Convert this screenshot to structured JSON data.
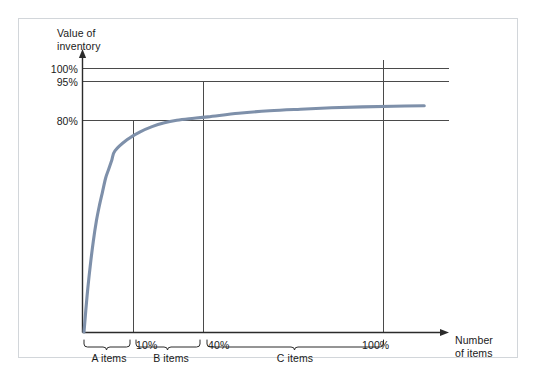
{
  "chart_data": {
    "type": "line",
    "title": "",
    "subtitle": "",
    "xlabel": "Number of items",
    "ylabel": "Value of inventory",
    "grid": true,
    "legend": null,
    "xlim": [
      0,
      118
    ],
    "ylim": [
      0,
      118
    ],
    "x_ticks": [
      {
        "value": 10,
        "label": "10%"
      },
      {
        "value": 40,
        "label": "40%"
      },
      {
        "value": 100,
        "label": "100%"
      }
    ],
    "y_ticks": [
      {
        "value": 80,
        "label": "80%"
      },
      {
        "value": 95,
        "label": "95%"
      },
      {
        "value": 100,
        "label": "100%"
      }
    ],
    "annotations": [
      {
        "label": "A items",
        "x_start": 0,
        "x_end": 10
      },
      {
        "label": "B items",
        "x_start": 10,
        "x_end": 40
      },
      {
        "label": "C items",
        "x_start": 40,
        "x_end": 100
      }
    ],
    "series": [
      {
        "name": "Cumulative value of inventory",
        "color": "#7e90aa",
        "x": [
          0,
          1,
          2,
          3,
          4,
          5,
          6,
          7,
          8,
          9,
          10,
          14,
          18,
          22,
          26,
          30,
          34,
          40,
          50,
          60,
          70,
          80,
          90,
          100,
          110
        ],
        "values": [
          0,
          16,
          29,
          40,
          49,
          56,
          62,
          68,
          72,
          76,
          80,
          85,
          88.3,
          90.7,
          92.4,
          93.5,
          94.2,
          95,
          96.6,
          97.7,
          98.4,
          99,
          99.4,
          99.7,
          99.9
        ]
      }
    ],
    "reference_lines": {
      "horizontal": [
        {
          "y": 100,
          "label": "100%"
        },
        {
          "y": 95,
          "label": "95%"
        },
        {
          "y": 80,
          "label": "80%"
        }
      ],
      "vertical": [
        {
          "x": 10,
          "label": "10%"
        },
        {
          "x": 40,
          "label": "40%"
        },
        {
          "x": 100,
          "label": "100%"
        }
      ]
    }
  },
  "axes": {
    "y_title": "Value of\ninventory",
    "x_title": "Number\nof items"
  },
  "labels": {
    "y_100": "100%",
    "y_95": "95%",
    "y_80": "80%",
    "x_10": "10%",
    "x_40": "40%",
    "x_100": "100%",
    "seg_a": "A items",
    "seg_b": "B items",
    "seg_c": "C items"
  },
  "colors": {
    "curve": "#7e90aa",
    "axis": "#2b2b2b",
    "gridline": "#4a4a4a",
    "frame_border": "#d2d6da",
    "background": "#ffffff",
    "text": "#1a1a1a"
  }
}
